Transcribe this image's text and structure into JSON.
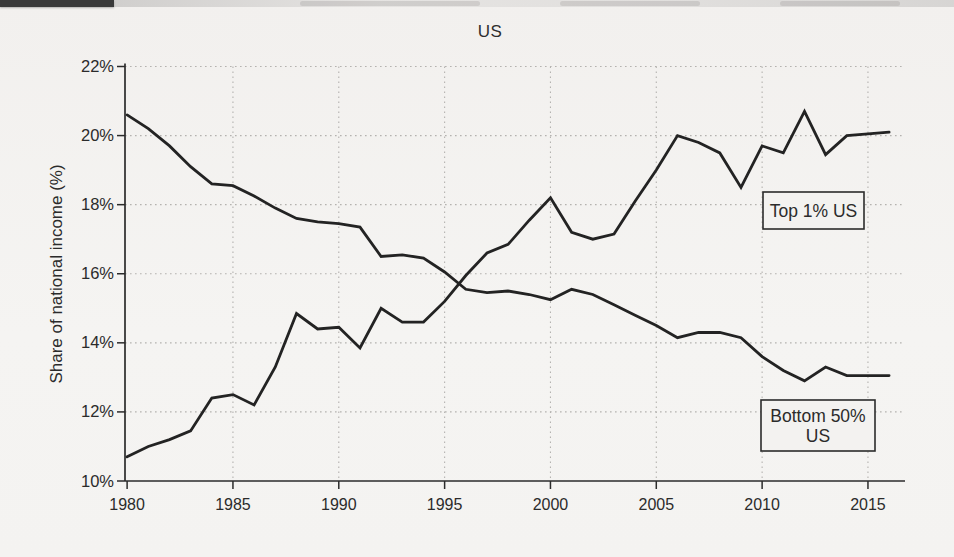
{
  "page": {
    "background_color": "#f3f2f0",
    "text_color": "#2b2b2b"
  },
  "chart_data": {
    "type": "line",
    "title": "US",
    "xlabel": "",
    "ylabel": "Share of national income (%)",
    "x": [
      1980,
      1981,
      1982,
      1983,
      1984,
      1985,
      1986,
      1987,
      1988,
      1989,
      1990,
      1991,
      1992,
      1993,
      1994,
      1995,
      1996,
      1997,
      1998,
      1999,
      2000,
      2001,
      2002,
      2003,
      2004,
      2005,
      2006,
      2007,
      2008,
      2009,
      2010,
      2011,
      2012,
      2013,
      2014,
      2015,
      2016
    ],
    "series": [
      {
        "name": "Top 1% US",
        "values": [
          10.7,
          11.0,
          11.2,
          11.45,
          12.4,
          12.5,
          12.2,
          13.3,
          14.85,
          14.4,
          14.45,
          13.85,
          15.0,
          14.6,
          14.6,
          15.2,
          15.95,
          16.6,
          16.85,
          17.55,
          18.2,
          17.2,
          17.0,
          17.15,
          18.1,
          19.0,
          20.0,
          19.8,
          19.5,
          18.5,
          19.7,
          19.5,
          20.7,
          19.45,
          20.0,
          20.05,
          20.1
        ]
      },
      {
        "name": "Bottom 50% US",
        "values": [
          20.6,
          20.2,
          19.7,
          19.1,
          18.6,
          18.55,
          18.25,
          17.9,
          17.6,
          17.5,
          17.45,
          17.35,
          16.5,
          16.55,
          16.45,
          16.05,
          15.55,
          15.45,
          15.5,
          15.4,
          15.25,
          15.55,
          15.4,
          15.1,
          14.8,
          14.5,
          14.15,
          14.3,
          14.3,
          14.15,
          13.6,
          13.2,
          12.9,
          13.3,
          13.05,
          13.05,
          13.05
        ]
      }
    ],
    "xlim": [
      1979.9,
      2016.75
    ],
    "ylim": [
      10,
      22
    ],
    "xticks": [
      1980,
      1985,
      1990,
      1995,
      2000,
      2005,
      2010,
      2015
    ],
    "xtick_labels": [
      "1980",
      "1985",
      "1990",
      "1995",
      "2000",
      "2005",
      "2010",
      "2015"
    ],
    "yticks": [
      10,
      12,
      14,
      16,
      18,
      20,
      22
    ],
    "ytick_labels": [
      "10%",
      "12%",
      "14%",
      "16%",
      "18%",
      "20%",
      "22%"
    ],
    "grid": true,
    "legend_position": "annotation-boxes",
    "line_color": "#232323",
    "grid_color": "#b4b2af",
    "axis_color": "#2b2b2b",
    "annotations": [
      {
        "lines": [
          "Top 1% US"
        ],
        "box": {
          "x": 763,
          "y": 192,
          "w": 101,
          "h": 37
        }
      },
      {
        "lines": [
          "Bottom 50%",
          "US"
        ],
        "box": {
          "x": 761,
          "y": 400,
          "w": 114,
          "h": 51
        }
      }
    ]
  }
}
